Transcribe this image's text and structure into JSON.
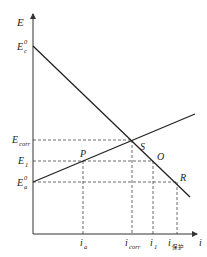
{
  "diagram": {
    "type": "polarization-diagram",
    "axes": {
      "y_label": "E",
      "x_label": "i"
    },
    "y_labels": [
      {
        "main": "E",
        "sub": "c",
        "sup": "0",
        "id": "Ec0"
      },
      {
        "main": "E",
        "sub": "corr",
        "sup": "",
        "id": "Ecorr"
      },
      {
        "main": "E",
        "sub": "1",
        "sup": "",
        "id": "E1"
      },
      {
        "main": "E",
        "sub": "a",
        "sup": "0",
        "id": "Ea0"
      }
    ],
    "x_labels": [
      {
        "main": "i",
        "sub": "a",
        "id": "ia"
      },
      {
        "main": "i",
        "sub": "corr",
        "id": "icorr"
      },
      {
        "main": "i",
        "sub": "1",
        "id": "i1"
      },
      {
        "main": "i",
        "sub": "保护",
        "id": "iprot"
      }
    ],
    "points": [
      {
        "label": "S",
        "meaning": "intersection at Ecorr, icorr"
      },
      {
        "label": "P",
        "meaning": "anodic line at E1"
      },
      {
        "label": "O",
        "meaning": "cathodic line at E1"
      },
      {
        "label": "R",
        "meaning": "cathodic line at Ea0"
      }
    ],
    "lines": [
      {
        "name": "cathodic-polarization-line",
        "from": "Ec0",
        "to": "R"
      },
      {
        "name": "anodic-polarization-line",
        "from": "Ea0",
        "to": "upper-right"
      }
    ]
  }
}
